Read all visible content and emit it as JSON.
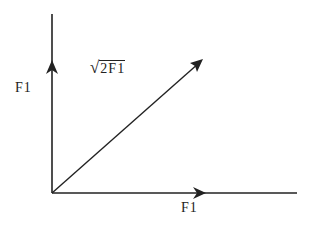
{
  "diagram": {
    "labels": {
      "vertical": "F1",
      "horizontal": "F1",
      "resultant_radical": "√",
      "resultant_radicand": "2F1"
    },
    "vectors": [
      {
        "name": "vertical",
        "from": [
          52,
          193
        ],
        "to": [
          52,
          14
        ],
        "arrowhead_at": [
          52,
          65
        ]
      },
      {
        "name": "horizontal",
        "from": [
          52,
          193
        ],
        "to": [
          297,
          193
        ],
        "arrowhead_at": [
          205,
          193
        ]
      },
      {
        "name": "resultant",
        "from": [
          52,
          193
        ],
        "to": [
          202,
          60
        ]
      }
    ],
    "colors": {
      "stroke": "#222222",
      "background": "#ffffff"
    }
  }
}
